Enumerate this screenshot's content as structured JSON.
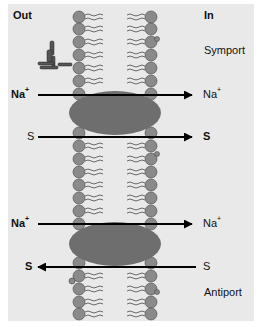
{
  "labels": {
    "out": "Out",
    "in": "In",
    "symport": "Symport",
    "antiport": "Antiport"
  },
  "symport": {
    "na_left": "Na",
    "na_left_sup": "+",
    "na_right": "Na",
    "na_right_sup": "+",
    "s_left": "S",
    "s_right": "S"
  },
  "antiport": {
    "na_left": "Na",
    "na_left_sup": "+",
    "na_right": "Na",
    "na_right_sup": "+",
    "s_left": "S",
    "s_right": "S"
  },
  "colors": {
    "background": "#e9e9e9",
    "lipid_head": "#8a8a8a",
    "protein": "#6e6e6e",
    "arrow": "#000000"
  }
}
